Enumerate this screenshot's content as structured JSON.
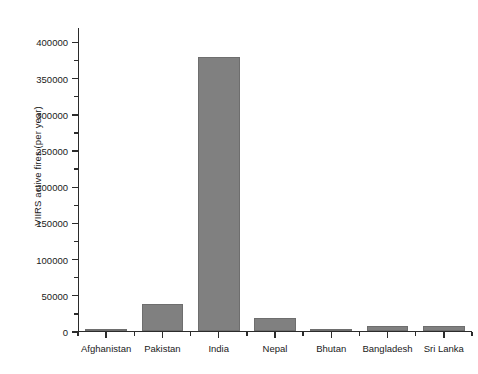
{
  "chart_data": {
    "type": "bar",
    "title": "",
    "xlabel": "",
    "ylabel": "VIIRS active fires (per year)",
    "categories": [
      "Afghanistan",
      "Pakistan",
      "India",
      "Nepal",
      "Bhutan",
      "Bangladesh",
      "Sri Lanka"
    ],
    "values": [
      300,
      37000,
      378000,
      18000,
      300,
      7000,
      6500
    ],
    "ylim": [
      0,
      420000
    ],
    "ytick_labels": [
      "0",
      "50000",
      "100000",
      "150000",
      "200000",
      "250000",
      "300000",
      "350000",
      "400000"
    ],
    "ytick_values": [
      0,
      50000,
      100000,
      150000,
      200000,
      250000,
      300000,
      350000,
      400000
    ],
    "yminor_values": [
      25000,
      75000,
      125000,
      175000,
      225000,
      275000,
      325000,
      375000
    ],
    "grid": false,
    "legend": false,
    "bar_color": "#808080",
    "axis_color": "#2b2b2b",
    "background": "#ffffff"
  }
}
